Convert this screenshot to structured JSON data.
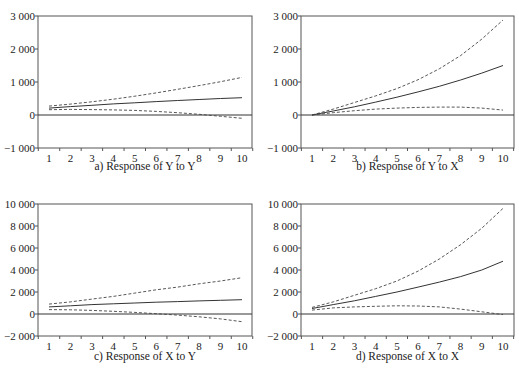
{
  "chart_data": [
    {
      "type": "line",
      "title": "a) Response of Y to Y",
      "xlabel": "",
      "ylabel": "",
      "x": [
        1,
        2,
        3,
        4,
        5,
        6,
        7,
        8,
        9,
        10
      ],
      "ylim": [
        -1000,
        3000
      ],
      "yticks": [
        -1000,
        0,
        1000,
        2000,
        3000
      ],
      "ytick_labels": [
        "−1 000",
        "0",
        "1 000",
        "2 000",
        "3 000"
      ],
      "xtick_labels": [
        "1",
        "2",
        "3",
        "4",
        "5",
        "6",
        "7",
        "8",
        "9",
        "10"
      ],
      "series": [
        {
          "name": "response",
          "style": "solid",
          "values": [
            210,
            255,
            295,
            335,
            370,
            405,
            440,
            470,
            500,
            525
          ]
        },
        {
          "name": "upper band",
          "style": "dashed",
          "values": [
            270,
            330,
            400,
            480,
            570,
            670,
            780,
            890,
            1010,
            1140
          ]
        },
        {
          "name": "lower band",
          "style": "dashed",
          "values": [
            160,
            170,
            165,
            155,
            140,
            110,
            70,
            20,
            -40,
            -100
          ]
        }
      ]
    },
    {
      "type": "line",
      "title": "b) Response of Y to X",
      "xlabel": "",
      "ylabel": "",
      "x": [
        1,
        2,
        3,
        4,
        5,
        6,
        7,
        8,
        9,
        10
      ],
      "ylim": [
        -1000,
        3000
      ],
      "yticks": [
        -1000,
        0,
        1000,
        2000,
        3000
      ],
      "ytick_labels": [
        "−1 000",
        "0",
        "1 000",
        "2 000",
        "3 000"
      ],
      "xtick_labels": [
        "1",
        "2",
        "3",
        "4",
        "5",
        "6",
        "7",
        "8",
        "9",
        "10"
      ],
      "series": [
        {
          "name": "response",
          "style": "solid",
          "values": [
            0,
            120,
            250,
            390,
            540,
            700,
            870,
            1060,
            1270,
            1500
          ]
        },
        {
          "name": "upper band",
          "style": "dashed",
          "values": [
            0,
            180,
            380,
            580,
            800,
            1070,
            1400,
            1800,
            2300,
            2880
          ]
        },
        {
          "name": "lower band",
          "style": "dashed",
          "values": [
            0,
            70,
            130,
            180,
            210,
            230,
            240,
            240,
            210,
            150
          ]
        }
      ]
    },
    {
      "type": "line",
      "title": "c) Response of X to Y",
      "xlabel": "",
      "ylabel": "",
      "x": [
        1,
        2,
        3,
        4,
        5,
        6,
        7,
        8,
        9,
        10
      ],
      "ylim": [
        -2000,
        10000
      ],
      "yticks": [
        -2000,
        0,
        2000,
        4000,
        6000,
        8000,
        10000
      ],
      "ytick_labels": [
        "−2 000",
        "0",
        "2 000",
        "4 000",
        "6 000",
        "8 000",
        "10 000"
      ],
      "xtick_labels": [
        "1",
        "2",
        "3",
        "4",
        "5",
        "6",
        "7",
        "8",
        "9",
        "10"
      ],
      "series": [
        {
          "name": "response",
          "style": "solid",
          "values": [
            650,
            750,
            850,
            930,
            1000,
            1070,
            1130,
            1190,
            1250,
            1300
          ]
        },
        {
          "name": "upper band",
          "style": "dashed",
          "values": [
            900,
            1100,
            1350,
            1600,
            1900,
            2200,
            2450,
            2750,
            3000,
            3300
          ]
        },
        {
          "name": "lower band",
          "style": "dashed",
          "values": [
            400,
            380,
            330,
            250,
            150,
            30,
            -100,
            -250,
            -450,
            -700
          ]
        }
      ]
    },
    {
      "type": "line",
      "title": "d) Response of X to X",
      "xlabel": "",
      "ylabel": "",
      "x": [
        1,
        2,
        3,
        4,
        5,
        6,
        7,
        8,
        9,
        10
      ],
      "ylim": [
        -2000,
        10000
      ],
      "yticks": [
        -2000,
        0,
        2000,
        4000,
        6000,
        8000,
        10000
      ],
      "ytick_labels": [
        "−2 000",
        "0",
        "2 000",
        "4 000",
        "6 000",
        "8 000",
        "10 000"
      ],
      "xtick_labels": [
        "1",
        "2",
        "3",
        "4",
        "5",
        "6",
        "7",
        "8",
        "9",
        "10"
      ],
      "series": [
        {
          "name": "response",
          "style": "solid",
          "values": [
            500,
            850,
            1200,
            1600,
            2000,
            2450,
            2900,
            3400,
            4000,
            4800
          ]
        },
        {
          "name": "upper band",
          "style": "dashed",
          "values": [
            600,
            1100,
            1700,
            2300,
            3000,
            3900,
            5000,
            6300,
            7800,
            9600
          ]
        },
        {
          "name": "lower band",
          "style": "dashed",
          "values": [
            350,
            550,
            650,
            700,
            750,
            730,
            650,
            450,
            200,
            -50
          ]
        }
      ]
    }
  ]
}
